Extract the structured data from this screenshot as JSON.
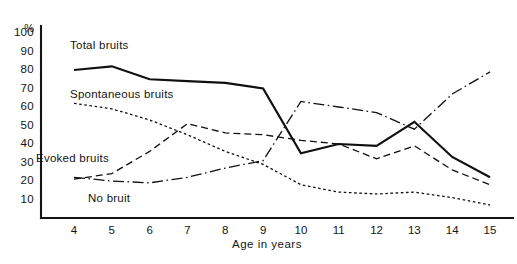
{
  "chart_data": {
    "type": "line",
    "title": "",
    "xlabel": "Age in years",
    "ylabel": "%",
    "x": [
      4,
      5,
      6,
      7,
      8,
      9,
      10,
      11,
      12,
      13,
      14,
      15
    ],
    "xlim": [
      4,
      15
    ],
    "ylim": [
      0,
      100
    ],
    "grid": false,
    "legend_position": "inline-annotations",
    "y_unit": "%",
    "y_ticks": [
      100,
      90,
      80,
      70,
      60,
      50,
      40,
      30,
      20,
      10
    ],
    "x_ticks": [
      "4",
      "5",
      "6",
      "7",
      "8",
      "9",
      "10",
      "11",
      "12",
      "13",
      "14",
      "15"
    ],
    "series": [
      {
        "name": "Total bruits",
        "style": "solid",
        "values": [
          80,
          82,
          75,
          74,
          73,
          70,
          35,
          40,
          39,
          52,
          33,
          22
        ]
      },
      {
        "name": "Spontaneous bruits",
        "style": "dotted",
        "values": [
          62,
          59,
          53,
          45,
          36,
          29,
          18,
          14,
          13,
          14,
          11,
          7
        ]
      },
      {
        "name": "Evoked bruits",
        "style": "dashed",
        "values": [
          21,
          24,
          36,
          51,
          46,
          45,
          42,
          40,
          32,
          39,
          26,
          18
        ]
      },
      {
        "name": "No bruit",
        "style": "dash-dot",
        "values": [
          22,
          20,
          19,
          22,
          27,
          31,
          63,
          60,
          57,
          48,
          67,
          79
        ]
      }
    ],
    "annotations": [
      {
        "text": "Total bruits",
        "x_px": 70,
        "y_px": 39
      },
      {
        "text": "Spontaneous bruits",
        "x_px": 70,
        "y_px": 88
      },
      {
        "text": "Evoked bruits",
        "x_px": 36,
        "y_px": 152
      },
      {
        "text": "No bruit",
        "x_px": 88,
        "y_px": 192
      }
    ],
    "axis_title_position": {
      "x_px": 232,
      "y_px": 244
    }
  },
  "geometry": {
    "plot_left_px": 41,
    "plot_bottom_px": 218,
    "plot_top_px": 33,
    "x_first_px": 74,
    "x_step_px": 37.82
  }
}
